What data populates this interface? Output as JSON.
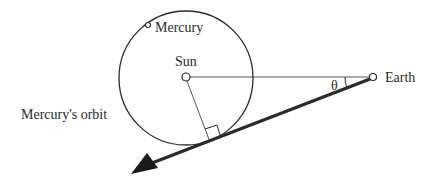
{
  "diagram": {
    "labels": {
      "mercury": "Mercury",
      "sun": "Sun",
      "earth": "Earth",
      "orbit": "Mercury's orbit",
      "angle": "θ"
    },
    "colors": {
      "ink": "#2a2a2a",
      "background": "#ffffff"
    },
    "elements": {
      "sun": {
        "x": 186,
        "y": 77,
        "r": 4
      },
      "orbit": {
        "cx": 186,
        "cy": 78,
        "r": 67
      },
      "earth": {
        "x": 373,
        "y": 77,
        "r": 3.5
      },
      "mercury_marker": {
        "x": 148,
        "y": 25,
        "r": 2.5
      },
      "tangent_point": {
        "x": 210,
        "y": 142
      },
      "arrow_tip": {
        "x": 131,
        "y": 173
      }
    }
  }
}
